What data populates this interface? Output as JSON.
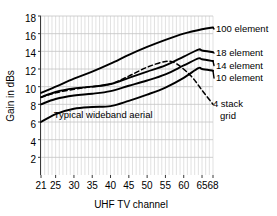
{
  "chart_data": {
    "type": "line",
    "title": "",
    "xlabel": "UHF TV channel",
    "ylabel": "Gain in dBs",
    "xlim": [
      21,
      68
    ],
    "ylim": [
      0,
      18
    ],
    "xticks": [
      "21",
      "25",
      "30",
      "35",
      "40",
      "45",
      "50",
      "55",
      "60",
      "65",
      "68"
    ],
    "xtick_values": [
      21,
      25,
      30,
      35,
      40,
      45,
      50,
      55,
      60,
      65,
      68
    ],
    "yticks": [
      "2",
      "4",
      "6",
      "8",
      "10",
      "12",
      "14",
      "16",
      "18"
    ],
    "ytick_values": [
      2,
      4,
      6,
      8,
      10,
      12,
      14,
      16,
      18
    ],
    "grid": "vertical minor per channel, horizontal major every 2 dB",
    "legend_position": "inline right of each curve",
    "annotations": [
      {
        "text": "Typical wideband aerial",
        "x": 38,
        "y": 6.4
      }
    ],
    "series": [
      {
        "name": "100 element",
        "style": "solid",
        "label": "100 element",
        "x": [
          21,
          25,
          30,
          35,
          40,
          45,
          50,
          55,
          60,
          65,
          68
        ],
        "values": [
          9.3,
          10.0,
          10.9,
          11.7,
          12.6,
          13.6,
          14.5,
          15.3,
          16.0,
          16.5,
          16.7
        ]
      },
      {
        "name": "18 element",
        "style": "solid",
        "label": "18 element",
        "x": [
          21,
          25,
          30,
          35,
          40,
          45,
          50,
          55,
          60,
          64,
          65,
          68
        ],
        "values": [
          8.8,
          9.4,
          9.8,
          10.0,
          10.3,
          11.0,
          11.7,
          12.4,
          13.4,
          14.2,
          14.1,
          13.9
        ]
      },
      {
        "name": "14 element",
        "style": "solid",
        "label": "14 element",
        "x": [
          21,
          25,
          30,
          35,
          40,
          45,
          50,
          55,
          60,
          64,
          65,
          68
        ],
        "values": [
          8.0,
          8.6,
          9.0,
          9.2,
          9.5,
          10.1,
          10.7,
          11.4,
          12.4,
          13.2,
          13.1,
          12.9
        ]
      },
      {
        "name": "10 element",
        "style": "solid",
        "label": "10 element",
        "x": [
          21,
          25,
          30,
          35,
          40,
          45,
          50,
          55,
          60,
          64,
          65,
          68
        ],
        "values": [
          6.0,
          6.9,
          7.5,
          7.7,
          7.8,
          8.4,
          9.1,
          9.9,
          11.0,
          12.1,
          12.0,
          11.8
        ]
      },
      {
        "name": "4 stack grid",
        "style": "dashed",
        "label": "4 stack grid",
        "x": [
          21,
          25,
          30,
          35,
          40,
          45,
          50,
          55,
          58,
          62,
          65,
          68
        ],
        "values": [
          8.8,
          9.3,
          9.7,
          10.0,
          10.3,
          11.2,
          12.2,
          12.85,
          12.6,
          11.2,
          9.6,
          8.0
        ]
      }
    ]
  },
  "series_labels": {
    "s100": "100 element",
    "s18": "18 element",
    "s14": "14 element",
    "s10": "10 element",
    "s4stack_line1": "4 stack",
    "s4stack_line2": "grid"
  },
  "axis": {
    "xlabel": "UHF TV channel",
    "ylabel": "Gain in dBs"
  },
  "annotation": {
    "wideband": "Typical wideband aerial"
  },
  "ytick_labels": {
    "t18": "18",
    "t16": "16",
    "t14": "14",
    "t12": "12",
    "t10": "10",
    "t8": "8",
    "t6": "6",
    "t4": "4",
    "t2": "2"
  },
  "xtick_labels": {
    "c21": "21",
    "c25": "25",
    "c30": "30",
    "c35": "35",
    "c40": "40",
    "c45": "45",
    "c50": "50",
    "c55": "55",
    "c60": "60",
    "c65": "65",
    "c68": "68"
  },
  "colors": {
    "line": "#000000",
    "grid_minor": "#d9d9d9",
    "grid_major": "#c4c4c4",
    "axis": "#3a3a3a",
    "background": "#ffffff"
  }
}
